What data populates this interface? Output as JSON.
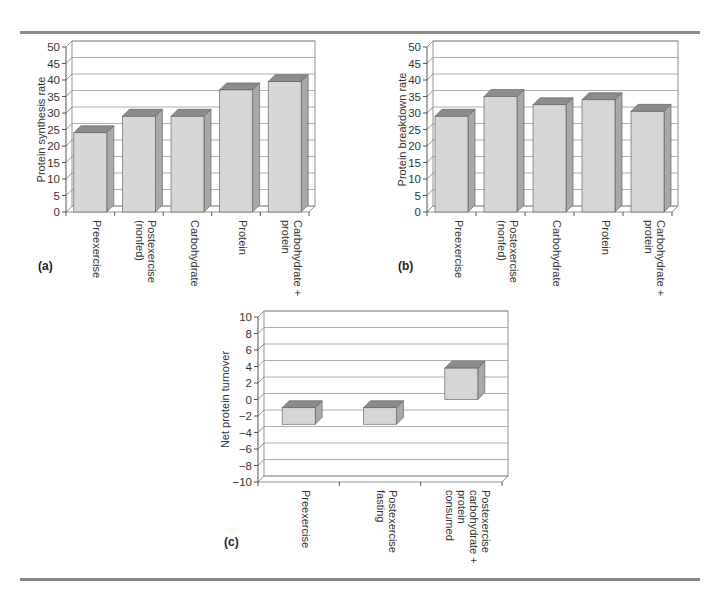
{
  "figure": {
    "panels": [
      "(a)",
      "(b)",
      "(c)"
    ]
  },
  "colors": {
    "bar_front": "#d6d6d6",
    "bar_top": "#8c8c8c",
    "bar_side": "#a9a9a9",
    "gridline": "#9a9a9a",
    "rule": "#8a8a8a"
  },
  "chart_data": [
    {
      "id": "a",
      "type": "bar",
      "title": "",
      "panel_label": "(a)",
      "xlabel": "",
      "ylabel": "Protein synthesis rate",
      "categories": [
        "Preexercise",
        "Postexercise (nonfed)",
        "Carbohydrate",
        "Protein",
        "Carbohydrate + protein"
      ],
      "category_lines": [
        [
          "Preexercise"
        ],
        [
          "Postexercise",
          "(nonfed)"
        ],
        [
          "Carbohydrate"
        ],
        [
          "Protein"
        ],
        [
          "Carbohydrate +",
          "protein"
        ]
      ],
      "values": [
        24,
        29,
        29,
        37,
        39.5
      ],
      "ylim": [
        0,
        50
      ],
      "yticks": [
        0,
        5,
        10,
        15,
        20,
        25,
        30,
        35,
        40,
        45,
        50
      ],
      "grid": true,
      "style": "3d-column"
    },
    {
      "id": "b",
      "type": "bar",
      "title": "",
      "panel_label": "(b)",
      "xlabel": "",
      "ylabel": "Protein breakdown rate",
      "categories": [
        "Preexercise",
        "Postexercise (nonfed)",
        "Carbohydrate",
        "Protein",
        "Carbohydrate + protein"
      ],
      "category_lines": [
        [
          "Preexercise"
        ],
        [
          "Postexercise",
          "(nonfed)"
        ],
        [
          "Carbohydrate"
        ],
        [
          "Protein"
        ],
        [
          "Carbohydrate +",
          "protein"
        ]
      ],
      "values": [
        29,
        35,
        32.5,
        34,
        30.5
      ],
      "ylim": [
        0,
        50
      ],
      "yticks": [
        0,
        5,
        10,
        15,
        20,
        25,
        30,
        35,
        40,
        45,
        50
      ],
      "grid": true,
      "style": "3d-column"
    },
    {
      "id": "c",
      "type": "bar",
      "title": "",
      "panel_label": "(c)",
      "xlabel": "",
      "ylabel": "Net protein turnover",
      "categories": [
        "Preexercise",
        "Postexercise fasting",
        "Postexercise carbohydrate + protein consumed"
      ],
      "category_lines": [
        [
          "Preexercise"
        ],
        [
          "Postexercise",
          "fasting"
        ],
        [
          "Postexercise",
          "carbohydrate +",
          "protein",
          "consumed"
        ]
      ],
      "values": [
        -2,
        -2,
        3.8
      ],
      "bar_spans": [
        [
          -3,
          -1
        ],
        [
          -3,
          -1
        ],
        [
          0,
          3.8
        ]
      ],
      "ylim": [
        -10,
        10
      ],
      "yticks": [
        -10,
        -8,
        -6,
        -4,
        -2,
        0,
        2,
        4,
        6,
        8,
        10
      ],
      "ytick_labels": [
        "−10",
        "−8",
        "−6",
        "−4",
        "−2",
        "0",
        "2",
        "4",
        "6",
        "8",
        "10"
      ],
      "grid": true,
      "style": "3d-column"
    }
  ]
}
